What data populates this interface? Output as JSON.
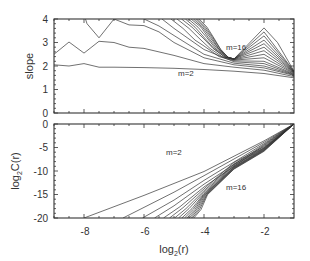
{
  "chart_data": [
    {
      "type": "line",
      "panel": "top",
      "title": "",
      "xlabel": "",
      "ylabel": "slope",
      "xlim": [
        -9,
        -1
      ],
      "ylim": [
        0,
        4
      ],
      "yticks": [
        0,
        1,
        2,
        3,
        4
      ],
      "xticks": [
        -8,
        -6,
        -4,
        -2
      ],
      "xtick_labels_visible": false,
      "grid": false,
      "legend": null,
      "annotations": [
        {
          "text": "m=16",
          "x": -3.0,
          "y": 3.05
        },
        {
          "text": "m=2",
          "x": -4.3,
          "y": 1.75
        }
      ],
      "series": [
        {
          "name": "m=2",
          "x": [
            -9,
            -8.5,
            -8,
            -7.5,
            -7,
            -6,
            -5,
            -4,
            -3,
            -2,
            -1
          ],
          "y": [
            2.05,
            2.0,
            2.1,
            1.95,
            1.95,
            1.93,
            1.9,
            1.85,
            1.78,
            1.68,
            1.5
          ]
        },
        {
          "name": "m=3",
          "x": [
            -9,
            -8.5,
            -8,
            -7.5,
            -7,
            -6.5,
            -6,
            -5,
            -4,
            -3,
            -2,
            -1
          ],
          "y": [
            2.5,
            3.02,
            2.55,
            3.05,
            3.0,
            2.8,
            2.75,
            2.45,
            2.1,
            1.95,
            1.82,
            1.55
          ]
        },
        {
          "name": "m=4",
          "x": [
            -7.95,
            -7.9,
            -7.5,
            -7,
            -6.5,
            -6,
            -5.5,
            -5,
            -4,
            -3,
            -2,
            -1
          ],
          "y": [
            4.0,
            3.8,
            3.2,
            4.0,
            3.75,
            3.72,
            3.45,
            3.0,
            2.35,
            2.05,
            1.92,
            1.6
          ]
        },
        {
          "name": "m=5",
          "x": [
            -6.0,
            -5.5,
            -5,
            -4.5,
            -4,
            -3,
            -2,
            -1
          ],
          "y": [
            4.0,
            3.7,
            3.3,
            2.9,
            2.5,
            2.12,
            2.0,
            1.62
          ]
        },
        {
          "name": "m=6",
          "x": [
            -5.4,
            -5,
            -4.5,
            -4,
            -3,
            -2,
            -1
          ],
          "y": [
            4.0,
            3.6,
            3.15,
            2.7,
            2.18,
            2.1,
            1.64
          ]
        },
        {
          "name": "m=7",
          "x": [
            -5.1,
            -4.7,
            -4.3,
            -4,
            -3.5,
            -3,
            -2,
            -1
          ],
          "y": [
            4.0,
            3.6,
            3.1,
            2.85,
            2.4,
            2.22,
            2.2,
            1.66
          ]
        },
        {
          "name": "m=8",
          "x": [
            -4.9,
            -4.5,
            -4.1,
            -3.8,
            -3.4,
            -3,
            -2,
            -1
          ],
          "y": [
            4.0,
            3.6,
            3.1,
            2.75,
            2.4,
            2.25,
            2.35,
            1.68
          ]
        },
        {
          "name": "m=9",
          "x": [
            -4.75,
            -4.4,
            -4.0,
            -3.7,
            -3.3,
            -3,
            -2,
            -1
          ],
          "y": [
            4.0,
            3.65,
            3.15,
            2.75,
            2.38,
            2.27,
            2.5,
            1.7
          ]
        },
        {
          "name": "m=10",
          "x": [
            -4.62,
            -4.3,
            -3.95,
            -3.65,
            -3.3,
            -3,
            -2,
            -1
          ],
          "y": [
            4.0,
            3.65,
            3.15,
            2.72,
            2.38,
            2.28,
            2.65,
            1.72
          ]
        },
        {
          "name": "m=11",
          "x": [
            -4.52,
            -4.2,
            -3.9,
            -3.6,
            -3.25,
            -3,
            -2,
            -1
          ],
          "y": [
            4.0,
            3.65,
            3.2,
            2.72,
            2.38,
            2.3,
            2.8,
            1.73
          ]
        },
        {
          "name": "m=12",
          "x": [
            -4.43,
            -4.1,
            -3.85,
            -3.55,
            -3.25,
            -3,
            -2,
            -1
          ],
          "y": [
            4.0,
            3.65,
            3.2,
            2.72,
            2.38,
            2.3,
            2.95,
            1.74
          ]
        },
        {
          "name": "m=13",
          "x": [
            -4.35,
            -4.05,
            -3.8,
            -3.5,
            -3.2,
            -3,
            -2,
            -1
          ],
          "y": [
            4.0,
            3.65,
            3.22,
            2.7,
            2.37,
            2.3,
            3.1,
            1.75
          ]
        },
        {
          "name": "m=14",
          "x": [
            -4.28,
            -4.0,
            -3.75,
            -3.5,
            -3.2,
            -3,
            -2,
            -1
          ],
          "y": [
            4.0,
            3.65,
            3.22,
            2.72,
            2.37,
            2.3,
            3.28,
            1.76
          ]
        },
        {
          "name": "m=15",
          "x": [
            -4.22,
            -3.95,
            -3.72,
            -3.45,
            -3.2,
            -3,
            -2,
            -1
          ],
          "y": [
            4.0,
            3.65,
            3.24,
            2.7,
            2.37,
            2.3,
            3.45,
            1.77
          ]
        },
        {
          "name": "m=16",
          "x": [
            -4.16,
            -3.9,
            -3.7,
            -3.45,
            -3.2,
            -3,
            -2,
            -1.55,
            -1
          ],
          "y": [
            4.0,
            3.65,
            3.25,
            2.72,
            2.37,
            2.3,
            3.62,
            3.0,
            1.78
          ]
        }
      ]
    },
    {
      "type": "line",
      "panel": "bottom",
      "title": "",
      "xlabel": "log2(r)",
      "ylabel": "log2C(r)",
      "xlim": [
        -9,
        -1
      ],
      "ylim": [
        -20,
        0
      ],
      "yticks": [
        -20,
        -15,
        -10,
        -5,
        0
      ],
      "xticks": [
        -8,
        -6,
        -4,
        -2
      ],
      "grid": false,
      "legend": null,
      "annotations": [
        {
          "text": "m=2",
          "x": -4.3,
          "y": -5.3
        },
        {
          "text": "m=16",
          "x": -3.0,
          "y": -12.2
        }
      ],
      "series": [
        {
          "name": "m=2",
          "x": [
            -8.0,
            -6,
            -4,
            -2,
            -1
          ],
          "y": [
            -20,
            -15.2,
            -10.1,
            -3.6,
            0
          ]
        },
        {
          "name": "m=3",
          "x": [
            -6.7,
            -5,
            -4,
            -2,
            -1
          ],
          "y": [
            -20,
            -14.5,
            -11.0,
            -3.9,
            0
          ]
        },
        {
          "name": "m=4",
          "x": [
            -6.05,
            -5,
            -4,
            -2,
            -1
          ],
          "y": [
            -20,
            -16.2,
            -12.0,
            -4.2,
            0
          ]
        },
        {
          "name": "m=5",
          "x": [
            -5.65,
            -5,
            -4,
            -2,
            -1
          ],
          "y": [
            -20,
            -17.4,
            -12.8,
            -4.4,
            0
          ]
        },
        {
          "name": "m=6",
          "x": [
            -5.35,
            -4.8,
            -4,
            -2,
            -1
          ],
          "y": [
            -20,
            -17.6,
            -13.4,
            -4.6,
            0
          ]
        },
        {
          "name": "m=7",
          "x": [
            -5.15,
            -4.7,
            -4,
            -3,
            -2,
            -1
          ],
          "y": [
            -20,
            -17.8,
            -13.8,
            -8.2,
            -4.8,
            0
          ]
        },
        {
          "name": "m=8",
          "x": [
            -4.98,
            -4.6,
            -4,
            -3,
            -2,
            -1
          ],
          "y": [
            -20,
            -18.0,
            -14.2,
            -8.5,
            -5.0,
            0
          ]
        },
        {
          "name": "m=9",
          "x": [
            -4.85,
            -4.5,
            -4,
            -3,
            -2,
            -1
          ],
          "y": [
            -20,
            -18.0,
            -14.5,
            -8.7,
            -5.1,
            0
          ]
        },
        {
          "name": "m=10",
          "x": [
            -4.74,
            -4.4,
            -4,
            -3,
            -2,
            -1
          ],
          "y": [
            -20,
            -18.0,
            -14.8,
            -8.9,
            -5.2,
            0
          ]
        },
        {
          "name": "m=11",
          "x": [
            -4.65,
            -4.35,
            -4,
            -3,
            -2,
            -1
          ],
          "y": [
            -20,
            -18.1,
            -15.0,
            -9.1,
            -5.3,
            0
          ]
        },
        {
          "name": "m=12",
          "x": [
            -4.57,
            -4.3,
            -4,
            -3,
            -2,
            -1
          ],
          "y": [
            -20,
            -18.2,
            -15.2,
            -9.2,
            -5.4,
            0
          ]
        },
        {
          "name": "m=13",
          "x": [
            -4.5,
            -4.25,
            -3.95,
            -3,
            -2,
            -1
          ],
          "y": [
            -20,
            -18.2,
            -15.0,
            -9.3,
            -5.5,
            0
          ]
        },
        {
          "name": "m=14",
          "x": [
            -4.44,
            -4.2,
            -3.92,
            -3,
            -2,
            -1
          ],
          "y": [
            -20,
            -18.2,
            -15.0,
            -9.4,
            -5.6,
            0
          ]
        },
        {
          "name": "m=15",
          "x": [
            -4.39,
            -4.15,
            -3.9,
            -3,
            -2,
            -1
          ],
          "y": [
            -20,
            -18.2,
            -15.0,
            -9.5,
            -5.7,
            0
          ]
        },
        {
          "name": "m=16",
          "x": [
            -4.34,
            -4.1,
            -3.88,
            -3,
            -2,
            -1
          ],
          "y": [
            -20,
            -18.2,
            -15.0,
            -9.6,
            -5.8,
            0
          ]
        }
      ]
    }
  ],
  "labels": {
    "top_ylabel": "slope",
    "bottom_ylabel_main": "log",
    "bottom_ylabel_sub": "2",
    "bottom_ylabel_rest": "C(r)",
    "xlabel_main": "log",
    "xlabel_sub": "2",
    "xlabel_rest": "(r)",
    "top_annot_m16": "m=16",
    "top_annot_m2": "m=2",
    "bottom_annot_m2": "m=2",
    "bottom_annot_m16": "m=16"
  },
  "ticks": {
    "top_y": [
      "4",
      "3",
      "2",
      "1",
      "0"
    ],
    "bottom_y": [
      "0",
      "-5",
      "-10",
      "-15",
      "-20"
    ],
    "x": [
      "-8",
      "-6",
      "-4",
      "-2"
    ]
  },
  "colors": {
    "line": "#333333",
    "background": "#ffffff"
  }
}
